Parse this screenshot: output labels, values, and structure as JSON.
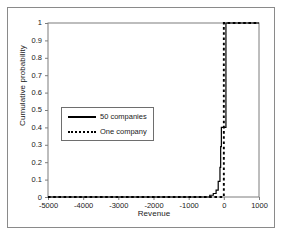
{
  "chart_data": {
    "type": "line",
    "title": "",
    "xlabel": "Revenue",
    "ylabel": "Cumulative probability",
    "xlim": [
      -5000,
      1000
    ],
    "ylim": [
      0,
      1
    ],
    "xticks": [
      "-5000",
      "-4000",
      "-3000",
      "-2000",
      "-1000",
      "0",
      "1000"
    ],
    "xtick_values": [
      -5000,
      -4000,
      -3000,
      -2000,
      -1000,
      0,
      1000
    ],
    "yticks": [
      "0",
      "0.1",
      "0.2",
      "0.3",
      "0.4",
      "0.5",
      "0.6",
      "0.7",
      "0.8",
      "0.9",
      "1"
    ],
    "ytick_values": [
      0,
      0.1,
      0.2,
      0.3,
      0.4,
      0.5,
      0.6,
      0.7,
      0.8,
      0.9,
      1
    ],
    "grid": false,
    "legend_position": "center-left",
    "series": [
      {
        "name": "50 companies",
        "style": "solid",
        "color": "#000000",
        "points": [
          [
            -5000,
            0.0
          ],
          [
            -600,
            0.0
          ],
          [
            -400,
            0.01
          ],
          [
            -300,
            0.02
          ],
          [
            -220,
            0.04
          ],
          [
            -160,
            0.09
          ],
          [
            -120,
            0.09
          ],
          [
            -110,
            0.17
          ],
          [
            -90,
            0.29
          ],
          [
            -70,
            0.4
          ],
          [
            55,
            0.4
          ],
          [
            60,
            1.0
          ],
          [
            1000,
            1.0
          ]
        ]
      },
      {
        "name": "One company",
        "style": "dashed",
        "color": "#000000",
        "points": [
          [
            -5000,
            0.0
          ],
          [
            0,
            0.0
          ],
          [
            0,
            1.0
          ],
          [
            1000,
            1.0
          ]
        ]
      }
    ]
  },
  "axes": {
    "xlabel": "Revenue",
    "ylabel": "Cumulative probability",
    "xticks": [
      "-5000",
      "-4000",
      "-3000",
      "-2000",
      "-1000",
      "0",
      "1000"
    ],
    "yticks": [
      "1",
      "0.9",
      "0.8",
      "0.7",
      "0.6",
      "0.5",
      "0.4",
      "0.3",
      "0.2",
      "0.1",
      "0"
    ]
  },
  "legend": {
    "entries": [
      {
        "label": "50 companies",
        "style": "solid"
      },
      {
        "label": "One company",
        "style": "dashed"
      }
    ]
  },
  "colors": {
    "line": "#000000",
    "frame": "#6e6e6e",
    "border": "#8a8a8a",
    "text": "#1a1a1a",
    "background": "#ffffff"
  }
}
